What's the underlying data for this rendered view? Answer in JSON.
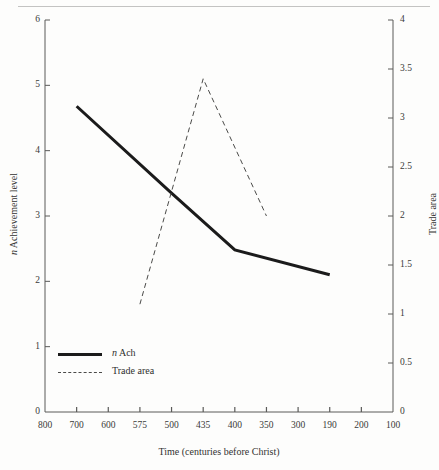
{
  "figure": {
    "background_color": "#fdfdfc",
    "ink_color": "#1b1b1b",
    "dash_color": "#4a4a48",
    "axis_color": "#5a5a58"
  },
  "legend": {
    "position": "inside-lower-left",
    "entries": [
      {
        "label": "n Ach",
        "label_prefix_italic": "n",
        "label_rest": " Ach",
        "style": "solid"
      },
      {
        "label": "Trade area",
        "style": "dashed"
      }
    ]
  },
  "chart_data": {
    "type": "line",
    "title": "",
    "subtitle": "",
    "xlabel": "Time (centuries before Christ)",
    "grid": false,
    "legend_position": "inside-lower-left",
    "x_tick_labels": [
      "800",
      "700",
      "600",
      "575",
      "500",
      "435",
      "400",
      "350",
      "300",
      "190",
      "200",
      "100"
    ],
    "x_tick_slots": [
      0,
      1,
      2,
      3,
      4,
      5,
      6,
      7,
      8,
      9,
      10,
      11
    ],
    "axes": [
      {
        "id": "left",
        "ylabel": "n Achievement level",
        "ylabel_prefix_italic": "n",
        "ylabel_rest": " Achievement level",
        "ylim": [
          0,
          6
        ],
        "ytick_labels": [
          "0",
          "1",
          "2",
          "3",
          "4",
          "5",
          "6"
        ],
        "ytick_values": [
          0,
          1,
          2,
          3,
          4,
          5,
          6
        ]
      },
      {
        "id": "right",
        "ylabel": "Trade area",
        "ylim": [
          0,
          4
        ],
        "ytick_labels": [
          "0",
          "0.5",
          "1",
          "1.5",
          "2",
          "2.5",
          "3",
          "3.5",
          "4"
        ],
        "ytick_values": [
          0,
          0.5,
          1,
          1.5,
          2,
          2.5,
          3,
          3.5,
          4
        ]
      }
    ],
    "series": [
      {
        "name": "n Ach",
        "axis": "left",
        "style": "solid",
        "linewidth": 3,
        "color": "#1b1b1b",
        "points": [
          {
            "x_label": "700",
            "x_slot": 1,
            "y": 4.68
          },
          {
            "x_label": "500",
            "x_slot": 4,
            "y": 3.35
          },
          {
            "x_label": "400",
            "x_slot": 6,
            "y": 2.48
          },
          {
            "x_label": "190",
            "x_slot": 9,
            "y": 2.1
          }
        ]
      },
      {
        "name": "Trade area",
        "axis": "right",
        "style": "dashed",
        "linewidth": 1,
        "color": "#4a4a48",
        "points": [
          {
            "x_label": "575",
            "x_slot": 3,
            "y": 1.1
          },
          {
            "x_label": "435",
            "x_slot": 5,
            "y": 3.4
          },
          {
            "x_label": "350",
            "x_slot": 7,
            "y": 2.0
          }
        ]
      }
    ]
  }
}
